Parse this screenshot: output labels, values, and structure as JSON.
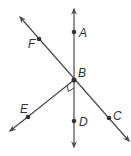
{
  "diagram": {
    "type": "geometry-lines",
    "colors": {
      "line": "#4a4a4a",
      "point": "#333333",
      "label": "#333333"
    },
    "points": [
      {
        "id": "A",
        "label": "A",
        "x": 74,
        "y": 32,
        "lx": 79,
        "ly": 37
      },
      {
        "id": "B",
        "label": "B",
        "x": 74,
        "y": 80,
        "lx": 78,
        "ly": 76
      },
      {
        "id": "C",
        "label": "C",
        "x": 109,
        "y": 118,
        "lx": 113,
        "ly": 119
      },
      {
        "id": "D",
        "label": "D",
        "x": 74,
        "y": 121,
        "lx": 79,
        "ly": 126
      },
      {
        "id": "E",
        "label": "E",
        "x": 28,
        "y": 117,
        "lx": 20,
        "ly": 113
      },
      {
        "id": "F",
        "label": "F",
        "x": 39,
        "y": 39,
        "lx": 28,
        "ly": 48
      }
    ],
    "lines": [
      {
        "name": "line-AD",
        "x1": 74,
        "y1": 9,
        "x2": 74,
        "y2": 147,
        "arrows": "both"
      },
      {
        "name": "line-FC",
        "x1": 20,
        "y1": 17,
        "x2": 129,
        "y2": 141,
        "arrows": "both"
      },
      {
        "name": "ray-BE",
        "x1": 74,
        "y1": 80,
        "x2": 10,
        "y2": 131,
        "arrows": "end"
      }
    ],
    "right_angle": {
      "between": [
        "BE",
        "BD"
      ],
      "at": "B"
    }
  }
}
